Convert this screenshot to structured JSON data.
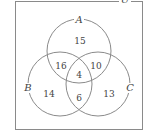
{
  "diagram": {
    "type": "venn",
    "universe_label": "U",
    "sets": [
      {
        "label": "A",
        "cx": 79,
        "cy": 51,
        "r": 32,
        "label_x": 79,
        "label_y": 23
      },
      {
        "label": "B",
        "cx": 60,
        "cy": 84,
        "r": 32,
        "label_x": 28,
        "label_y": 91
      },
      {
        "label": "C",
        "cx": 98,
        "cy": 84,
        "r": 32,
        "label_x": 130,
        "label_y": 91
      }
    ],
    "regions": {
      "A_only": "15",
      "B_only": "14",
      "C_only": "13",
      "A_and_B_only": "16",
      "A_and_C_only": "10",
      "B_and_C_only": "6",
      "A_B_C": "4"
    }
  }
}
